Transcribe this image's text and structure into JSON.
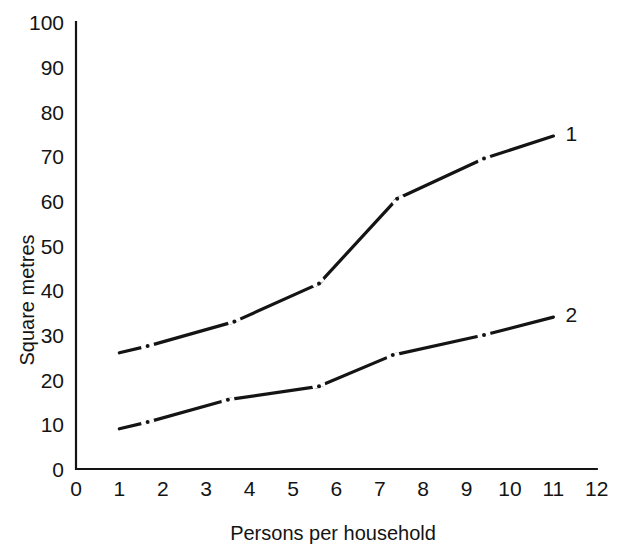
{
  "chart_data": {
    "type": "line",
    "title": "",
    "xlabel": "Persons per household",
    "ylabel": "Square metres",
    "xlim": [
      0,
      12
    ],
    "ylim": [
      0,
      100
    ],
    "grid": false,
    "legend_position": "line-end-labels",
    "x_ticks": [
      "0",
      "1",
      "2",
      "3",
      "4",
      "5",
      "6",
      "7",
      "8",
      "9",
      "10",
      "11",
      "12"
    ],
    "y_ticks": [
      "0",
      "10",
      "20",
      "30",
      "40",
      "50",
      "60",
      "70",
      "80",
      "90",
      "100"
    ],
    "series": [
      {
        "name": "1",
        "label": "1",
        "color": "#141414",
        "x": [
          1.0,
          1.65,
          3.65,
          5.6,
          7.4,
          9.4,
          11.0
        ],
        "values": [
          26,
          27.5,
          33,
          41.5,
          60.5,
          69.5,
          74.5
        ]
      },
      {
        "name": "2",
        "label": "2",
        "color": "#141414",
        "x": [
          1.0,
          1.65,
          3.5,
          5.6,
          7.3,
          9.4,
          11.0
        ],
        "values": [
          9,
          10.5,
          15.5,
          18.5,
          25.5,
          30,
          34
        ]
      }
    ]
  },
  "axes": {
    "y_axis_title": "Square metres",
    "x_axis_title": "Persons per household"
  },
  "labels": {
    "series_one": "1",
    "series_two": "2"
  }
}
